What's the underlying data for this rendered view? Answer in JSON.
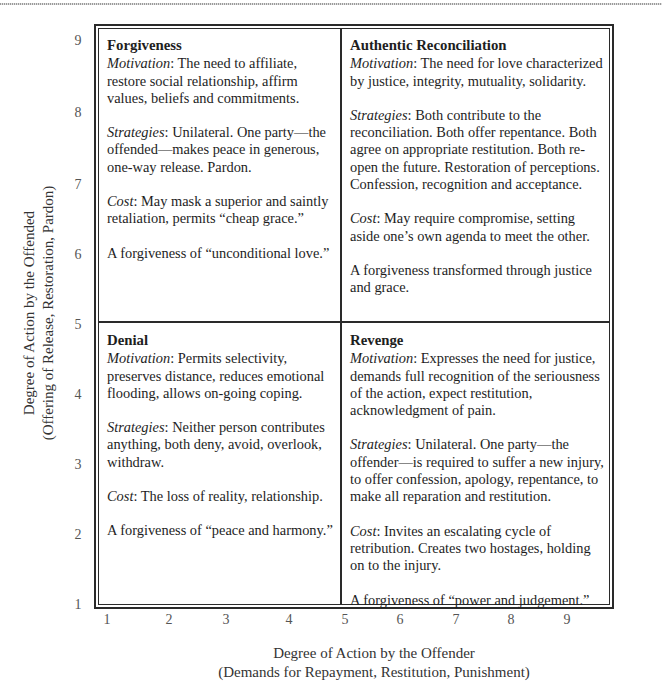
{
  "axes": {
    "y_label_line1": "Degree of Action by the Offended",
    "y_label_line2": "(Offering of Release, Restoration, Pardon)",
    "x_label_line1": "Degree of Action by the Offender",
    "x_label_line2": "(Demands for Repayment, Restitution, Punishment)",
    "y_ticks": [
      "9",
      "8",
      "7",
      "6",
      "5",
      "4",
      "3",
      "2",
      "1"
    ],
    "x_ticks": [
      "1",
      "2",
      "3",
      "4",
      "5",
      "6",
      "7",
      "8",
      "9"
    ]
  },
  "quadrants": {
    "top_left": {
      "title": "Forgiveness",
      "motivation_label": "Motivation",
      "motivation": ": The need to affiliate, restore social relationship, affirm values, beliefs and commitments.",
      "strategies_label": "Strategies",
      "strategies": ": Unilateral. One party—the offended—makes peace in generous, one-way release. Pardon.",
      "cost_label": "Cost",
      "cost": ": May mask a superior and saintly retaliation, permits “cheap grace.”",
      "summary": "A forgiveness of “unconditional love.”"
    },
    "top_right": {
      "title": "Authentic Reconciliation",
      "motivation_label": "Motivation",
      "motivation": ": The need for love characterized by justice, integrity, mutuality, solidarity.",
      "strategies_label": "Strategies",
      "strategies": ": Both contribute to the reconciliation. Both offer repentance. Both agree on appropriate restitution. Both re-open the future. Restoration of perceptions. Confession, recognition and acceptance.",
      "cost_label": "Cost",
      "cost": ": May require compromise, setting aside one’s own agenda to meet the other.",
      "summary": "A forgiveness transformed through justice and grace."
    },
    "bottom_left": {
      "title": "Denial",
      "motivation_label": "Motivation",
      "motivation": ": Permits selectivity, preserves distance, reduces emotional flooding, allows on-going coping.",
      "strategies_label": "Strategies",
      "strategies": ": Neither person contributes anything, both deny, avoid, overlook, withdraw.",
      "cost_label": "Cost",
      "cost": ": The loss of reality, relationship.",
      "summary": "A forgiveness of “peace and harmony.”"
    },
    "bottom_right": {
      "title": "Revenge",
      "motivation_label": "Motivation",
      "motivation": ": Expresses the need for justice, demands full recognition of the seriousness of the action, expect restitution, acknowledgment of pain.",
      "strategies_label": "Strategies",
      "strategies": ": Unilateral. One party—the offender—is required to suffer a new injury, to offer confession, apology, repentance, to make all reparation and restitution.",
      "cost_label": "Cost",
      "cost": ": Invites an escalating cycle of retribution. Creates two hostages, holding on to the injury.",
      "summary": "A forgiveness of “power and judgement.”"
    }
  }
}
